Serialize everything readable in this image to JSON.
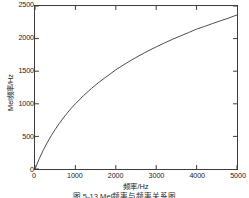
{
  "figure": {
    "caption": "图 5-13  Mel频率与频率关系图",
    "background_color": "#ffffff",
    "axis_color": "#3c3c3c",
    "curve_color": "#4d4d4d"
  },
  "axes": {
    "x_label": "频率/Hz",
    "y_label": "Mel频率/Hz",
    "x_ticks": [
      "0",
      "1000",
      "2000",
      "3000",
      "4000",
      "5000"
    ],
    "y_ticks": [
      "0",
      "500",
      "1000",
      "1500",
      "2000",
      "2500"
    ]
  },
  "chart_data": {
    "type": "line",
    "title": "",
    "subtitle": "",
    "xlabel": "频率/Hz",
    "ylabel": "Mel频率/Hz",
    "xlim": [
      0,
      5000
    ],
    "ylim": [
      0,
      2500
    ],
    "grid": false,
    "legend": null,
    "legend_position": "none",
    "x_ticks": [
      0,
      1000,
      2000,
      3000,
      4000,
      5000
    ],
    "y_ticks": [
      0,
      500,
      1000,
      1500,
      2000,
      2500
    ],
    "annotations": [],
    "series": [
      {
        "name": "Mel频率",
        "formula": "mel = 2595 * log10(1 + f / 700)",
        "color": "#4d4d4d",
        "line_width": 1,
        "x": [
          0,
          100,
          200,
          300,
          400,
          500,
          600,
          700,
          800,
          900,
          1000,
          1200,
          1400,
          1600,
          1800,
          2000,
          2200,
          2400,
          2600,
          2800,
          3000,
          3200,
          3400,
          3600,
          3800,
          4000,
          4200,
          4400,
          4600,
          4800,
          5000
        ],
        "values": [
          0,
          150,
          283,
          401,
          509,
          607,
          698,
          781,
          860,
          934,
          1000,
          1125,
          1237,
          1338,
          1430,
          1521,
          1600,
          1675,
          1745,
          1811,
          1873,
          1932,
          1988,
          2041,
          2092,
          2146,
          2187,
          2232,
          2275,
          2316,
          2363
        ]
      }
    ]
  }
}
